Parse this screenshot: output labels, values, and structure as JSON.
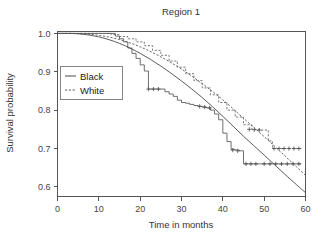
{
  "chart_data": {
    "type": "line",
    "title": "Region 1",
    "xlabel": "Time in months",
    "ylabel": "Survival probability",
    "xlim": [
      0,
      60
    ],
    "ylim": [
      0.575,
      1.005
    ],
    "xticks": [
      0,
      10,
      20,
      30,
      40,
      50,
      60
    ],
    "xticklabels": [
      "0",
      "10",
      "20",
      "30",
      "40",
      "50",
      "60"
    ],
    "yticks": [
      0.6,
      0.7,
      0.8,
      0.9,
      1.0
    ],
    "yticklabels": [
      "0.6",
      "0.7",
      "0.8",
      "0.9",
      "1.0"
    ],
    "grid": false,
    "legend_position": "upper left",
    "legend": [
      {
        "label": "Black",
        "style": "solid"
      },
      {
        "label": "White",
        "style": "dashed"
      }
    ],
    "series": [
      {
        "name": "Black (Kaplan-Meier step)",
        "group": "Black",
        "style": "solid",
        "kind": "step",
        "x": [
          0,
          13,
          14,
          15,
          16,
          17,
          18,
          19,
          20,
          21,
          22,
          25,
          26,
          27,
          28,
          29,
          30,
          31,
          32,
          33,
          34,
          35,
          36,
          37,
          38,
          39,
          40,
          41,
          42,
          43,
          44,
          45,
          59
        ],
        "y": [
          1.0,
          1.0,
          0.993,
          0.986,
          0.978,
          0.962,
          0.948,
          0.935,
          0.918,
          0.902,
          0.855,
          0.855,
          0.848,
          0.842,
          0.836,
          0.826,
          0.82,
          0.818,
          0.815,
          0.812,
          0.81,
          0.808,
          0.806,
          0.8,
          0.79,
          0.775,
          0.74,
          0.718,
          0.698,
          0.696,
          0.694,
          0.66,
          0.66
        ]
      },
      {
        "name": "White (Kaplan-Meier step)",
        "group": "White",
        "style": "dashed",
        "kind": "step",
        "x": [
          0,
          11,
          13,
          15,
          17,
          19,
          21,
          23,
          25,
          27,
          29,
          31,
          33,
          35,
          37,
          39,
          41,
          43,
          45,
          47,
          49,
          51,
          52,
          59
        ],
        "y": [
          1.0,
          1.0,
          0.997,
          0.992,
          0.986,
          0.978,
          0.968,
          0.956,
          0.943,
          0.928,
          0.912,
          0.895,
          0.877,
          0.858,
          0.84,
          0.82,
          0.8,
          0.782,
          0.762,
          0.75,
          0.748,
          0.72,
          0.7,
          0.7
        ]
      },
      {
        "name": "Black (fitted smooth)",
        "group": "Black",
        "style": "solid",
        "kind": "smooth",
        "x": [
          0,
          5,
          10,
          15,
          20,
          25,
          30,
          35,
          40,
          45,
          50,
          55,
          60
        ],
        "y": [
          1.0,
          0.999,
          0.991,
          0.974,
          0.948,
          0.915,
          0.876,
          0.833,
          0.784,
          0.732,
          0.683,
          0.633,
          0.585
        ]
      },
      {
        "name": "White (fitted smooth)",
        "group": "White",
        "style": "dashed",
        "kind": "smooth",
        "x": [
          0,
          5,
          10,
          15,
          20,
          25,
          30,
          35,
          40,
          45,
          50,
          55,
          60
        ],
        "y": [
          1.0,
          0.9995,
          0.995,
          0.984,
          0.965,
          0.939,
          0.907,
          0.869,
          0.827,
          0.779,
          0.731,
          0.681,
          0.63
        ]
      }
    ],
    "censor_marks": [
      {
        "group": "Black",
        "x": 22.0,
        "y": 0.855
      },
      {
        "group": "Black",
        "x": 23.2,
        "y": 0.855
      },
      {
        "group": "Black",
        "x": 24.4,
        "y": 0.855
      },
      {
        "group": "Black",
        "x": 34.4,
        "y": 0.81
      },
      {
        "group": "Black",
        "x": 35.6,
        "y": 0.808
      },
      {
        "group": "Black",
        "x": 36.8,
        "y": 0.806
      },
      {
        "group": "Black",
        "x": 42.4,
        "y": 0.696
      },
      {
        "group": "Black",
        "x": 43.6,
        "y": 0.694
      },
      {
        "group": "Black",
        "x": 45.6,
        "y": 0.66
      },
      {
        "group": "Black",
        "x": 46.8,
        "y": 0.66
      },
      {
        "group": "Black",
        "x": 48.0,
        "y": 0.66
      },
      {
        "group": "Black",
        "x": 50.0,
        "y": 0.66
      },
      {
        "group": "Black",
        "x": 51.4,
        "y": 0.66
      },
      {
        "group": "Black",
        "x": 52.8,
        "y": 0.66
      },
      {
        "group": "Black",
        "x": 54.2,
        "y": 0.66
      },
      {
        "group": "Black",
        "x": 55.6,
        "y": 0.66
      },
      {
        "group": "Black",
        "x": 57.0,
        "y": 0.66
      },
      {
        "group": "Black",
        "x": 58.4,
        "y": 0.66
      },
      {
        "group": "White",
        "x": 46.4,
        "y": 0.75
      },
      {
        "group": "White",
        "x": 47.6,
        "y": 0.749
      },
      {
        "group": "White",
        "x": 48.8,
        "y": 0.748
      },
      {
        "group": "White",
        "x": 52.4,
        "y": 0.7
      },
      {
        "group": "White",
        "x": 53.6,
        "y": 0.7
      },
      {
        "group": "White",
        "x": 54.8,
        "y": 0.7
      },
      {
        "group": "White",
        "x": 56.0,
        "y": 0.7
      },
      {
        "group": "White",
        "x": 57.2,
        "y": 0.7
      },
      {
        "group": "White",
        "x": 58.4,
        "y": 0.7
      }
    ]
  }
}
